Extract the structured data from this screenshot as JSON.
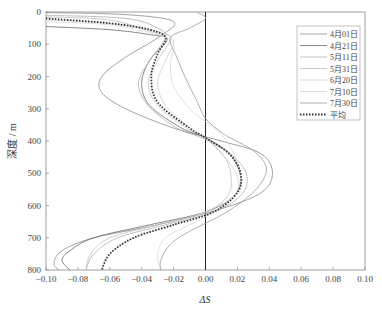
{
  "chart_data": {
    "type": "line",
    "title": "",
    "xlabel": "ΔS",
    "ylabel": "深度 / m",
    "xlim": [
      -0.1,
      0.1
    ],
    "ylim": [
      800,
      0
    ],
    "y_inverted": true,
    "grid": false,
    "legend_position": "upper right",
    "xticks": [
      "-0.10",
      "-0.08",
      "-0.06",
      "-0.04",
      "-0.02",
      "0.00",
      "0.02",
      "0.04",
      "0.06",
      "0.08",
      "0.10"
    ],
    "yticks": [
      "0",
      "100",
      "200",
      "300",
      "400",
      "500",
      "600",
      "700",
      "800"
    ],
    "reference_line": {
      "x": 0.0,
      "label": "ΔS = 0"
    },
    "series": [
      {
        "name": "4月01日",
        "color": "#8a8a8a",
        "width": 0.8,
        "dash": "",
        "points": [
          [
            -0.1,
            2
          ],
          [
            -0.05,
            8
          ],
          [
            -0.02,
            30
          ],
          [
            -0.03,
            80
          ],
          [
            -0.05,
            140
          ],
          [
            -0.065,
            200
          ],
          [
            -0.065,
            250
          ],
          [
            -0.05,
            300
          ],
          [
            -0.02,
            360
          ],
          [
            0.01,
            400
          ],
          [
            0.035,
            440
          ],
          [
            0.042,
            500
          ],
          [
            0.035,
            560
          ],
          [
            0.01,
            610
          ],
          [
            -0.03,
            660
          ],
          [
            -0.07,
            700
          ],
          [
            -0.09,
            740
          ],
          [
            -0.095,
            780
          ],
          [
            -0.092,
            800
          ]
        ]
      },
      {
        "name": "4月21日",
        "color": "#6a6a6a",
        "width": 0.8,
        "dash": "",
        "points": [
          [
            -0.1,
            45
          ],
          [
            -0.06,
            55
          ],
          [
            -0.035,
            70
          ],
          [
            -0.024,
            85
          ],
          [
            -0.035,
            150
          ],
          [
            -0.04,
            220
          ],
          [
            -0.035,
            290
          ],
          [
            -0.015,
            360
          ],
          [
            0.0,
            390
          ],
          [
            0.015,
            440
          ],
          [
            0.022,
            510
          ],
          [
            0.018,
            570
          ],
          [
            0.0,
            620
          ],
          [
            -0.035,
            660
          ],
          [
            -0.07,
            700
          ],
          [
            -0.085,
            740
          ],
          [
            -0.09,
            770
          ],
          [
            -0.085,
            800
          ]
        ]
      },
      {
        "name": "5月11日",
        "color": "#b0b0b0",
        "width": 0.8,
        "dash": "",
        "points": [
          [
            -0.1,
            10
          ],
          [
            -0.05,
            20
          ],
          [
            -0.03,
            50
          ],
          [
            -0.025,
            80
          ],
          [
            -0.035,
            150
          ],
          [
            -0.042,
            220
          ],
          [
            -0.036,
            290
          ],
          [
            -0.018,
            360
          ],
          [
            0.0,
            395
          ],
          [
            0.018,
            450
          ],
          [
            0.026,
            510
          ],
          [
            0.022,
            570
          ],
          [
            0.005,
            620
          ],
          [
            -0.025,
            660
          ],
          [
            -0.055,
            700
          ],
          [
            -0.07,
            750
          ],
          [
            -0.075,
            800
          ]
        ]
      },
      {
        "name": "5月31日",
        "color": "#c0c0c0",
        "width": 0.8,
        "dash": "",
        "points": [
          [
            -0.1,
            15
          ],
          [
            -0.06,
            25
          ],
          [
            -0.035,
            60
          ],
          [
            -0.022,
            80
          ],
          [
            -0.03,
            150
          ],
          [
            -0.036,
            220
          ],
          [
            -0.03,
            290
          ],
          [
            -0.012,
            360
          ],
          [
            0.0,
            390
          ],
          [
            0.012,
            450
          ],
          [
            0.016,
            510
          ],
          [
            0.014,
            570
          ],
          [
            0.0,
            620
          ],
          [
            -0.03,
            660
          ],
          [
            -0.06,
            700
          ],
          [
            -0.072,
            750
          ],
          [
            -0.075,
            800
          ]
        ]
      },
      {
        "name": "6月20日",
        "color": "#d0d0d0",
        "width": 0.8,
        "dash": "",
        "points": [
          [
            -0.1,
            25
          ],
          [
            -0.06,
            35
          ],
          [
            -0.03,
            60
          ],
          [
            -0.02,
            90
          ],
          [
            -0.025,
            150
          ],
          [
            -0.03,
            220
          ],
          [
            -0.025,
            290
          ],
          [
            -0.01,
            360
          ],
          [
            0.0,
            390
          ],
          [
            0.012,
            450
          ],
          [
            0.02,
            510
          ],
          [
            0.018,
            570
          ],
          [
            0.0,
            620
          ],
          [
            -0.02,
            660
          ],
          [
            -0.045,
            700
          ],
          [
            -0.06,
            750
          ],
          [
            -0.065,
            800
          ]
        ]
      },
      {
        "name": "7月10日",
        "color": "#d8d8d8",
        "width": 0.8,
        "dash": "",
        "points": [
          [
            -0.1,
            30
          ],
          [
            -0.06,
            40
          ],
          [
            -0.03,
            70
          ],
          [
            -0.02,
            100
          ],
          [
            -0.022,
            160
          ],
          [
            -0.02,
            230
          ],
          [
            -0.01,
            300
          ],
          [
            0.0,
            340
          ],
          [
            0.01,
            380
          ],
          [
            0.018,
            440
          ],
          [
            0.022,
            510
          ],
          [
            0.018,
            570
          ],
          [
            0.005,
            620
          ],
          [
            -0.01,
            660
          ],
          [
            -0.025,
            700
          ],
          [
            -0.03,
            750
          ],
          [
            -0.028,
            800
          ]
        ]
      },
      {
        "name": "7月30日",
        "color": "#9a9a9a",
        "width": 0.8,
        "dash": "",
        "points": [
          [
            -0.005,
            2
          ],
          [
            0.0,
            20
          ],
          [
            -0.01,
            50
          ],
          [
            -0.022,
            80
          ],
          [
            -0.018,
            140
          ],
          [
            -0.012,
            210
          ],
          [
            -0.005,
            280
          ],
          [
            0.0,
            330
          ],
          [
            0.012,
            380
          ],
          [
            0.03,
            430
          ],
          [
            0.038,
            480
          ],
          [
            0.035,
            530
          ],
          [
            0.025,
            580
          ],
          [
            0.01,
            630
          ],
          [
            -0.01,
            680
          ],
          [
            -0.022,
            720
          ],
          [
            -0.028,
            770
          ],
          [
            -0.028,
            800
          ]
        ]
      },
      {
        "name": "平均",
        "color": "#333333",
        "width": 1.8,
        "dash": "1.5,1.5",
        "points": [
          [
            -0.1,
            20
          ],
          [
            -0.06,
            35
          ],
          [
            -0.035,
            55
          ],
          [
            -0.025,
            80
          ],
          [
            -0.03,
            130
          ],
          [
            -0.034,
            200
          ],
          [
            -0.03,
            280
          ],
          [
            -0.01,
            360
          ],
          [
            0.0,
            390
          ],
          [
            0.015,
            440
          ],
          [
            0.022,
            500
          ],
          [
            0.02,
            560
          ],
          [
            0.005,
            620
          ],
          [
            -0.02,
            660
          ],
          [
            -0.045,
            700
          ],
          [
            -0.06,
            750
          ],
          [
            -0.065,
            800
          ]
        ]
      }
    ]
  }
}
